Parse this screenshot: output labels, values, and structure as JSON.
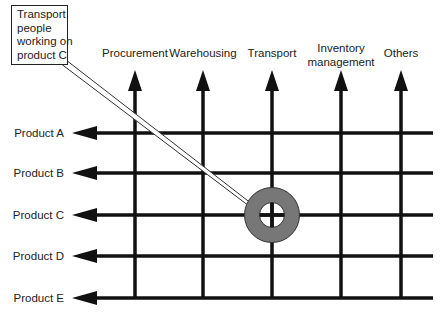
{
  "diagram": {
    "callout": {
      "lines": [
        "Transport",
        "people",
        "working on",
        "product C"
      ]
    },
    "columns": [
      {
        "label_lines": [
          "Procurement"
        ],
        "x": 135
      },
      {
        "label_lines": [
          "Warehousing"
        ],
        "x": 203
      },
      {
        "label_lines": [
          "Transport"
        ],
        "x": 272
      },
      {
        "label_lines": [
          "Inventory",
          "management"
        ],
        "x": 341
      },
      {
        "label_lines": [
          "Others"
        ],
        "x": 401
      }
    ],
    "rows": [
      {
        "label": "Product A",
        "y": 133
      },
      {
        "label": "Product B",
        "y": 173
      },
      {
        "label": "Product C",
        "y": 215
      },
      {
        "label": "Product D",
        "y": 256
      },
      {
        "label": "Product E",
        "y": 298
      }
    ],
    "highlight": {
      "column": "Transport",
      "row": "Product C",
      "ring_color": "#777777"
    },
    "colors": {
      "line": "#111111",
      "text": "#222222"
    }
  }
}
